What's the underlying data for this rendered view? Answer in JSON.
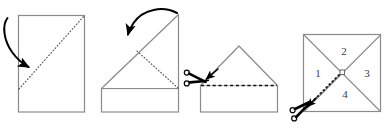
{
  "figure": {
    "title": "Paper folding and cutting instruction diagram",
    "background_color": "#ffffff",
    "width": 385,
    "height": 128,
    "stroke_color": "#8a8a8a",
    "accent_color": "#000000",
    "label_color": "#3a3a3a"
  },
  "panels": [
    {
      "id": "panel-1",
      "name": "fold-paper-diagonally",
      "caption": "",
      "shape": "rectangle",
      "fold_line_style": "dotted",
      "arrow": "curved-down-right",
      "labels": []
    },
    {
      "id": "panel-2",
      "name": "fold-triangle-again",
      "caption": "",
      "shape": "triangle-on-rectangle",
      "fold_line_style": "dotted",
      "arrow": "curved-left",
      "labels": []
    },
    {
      "id": "panel-3",
      "name": "cut-along-dashed-line",
      "caption": "",
      "shape": "house",
      "fold_line_style": "dashed",
      "tool": "scissors",
      "labels": []
    },
    {
      "id": "panel-4",
      "name": "unfolded-square-quadrants",
      "caption": "",
      "shape": "square-with-diagonals",
      "fold_line_style": "dotted",
      "tool": "scissors",
      "labels": [
        {
          "text": "1",
          "position": "left"
        },
        {
          "text": "2",
          "position": "top"
        },
        {
          "text": "3",
          "position": "right"
        },
        {
          "text": "4",
          "position": "bottom"
        }
      ]
    }
  ],
  "quadrant_numbers": {
    "left": "1",
    "top": "2",
    "right": "3",
    "bottom": "4"
  }
}
